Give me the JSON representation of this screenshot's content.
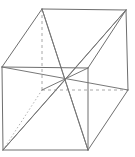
{
  "figure": {
    "type": "line-drawing",
    "projection": "oblique",
    "canvas": {
      "width": 135,
      "height": 157,
      "background": "#ffffff"
    },
    "style": {
      "visible_edge_color": "#6e6e6e",
      "hidden_edge_color": "#a8a8a8",
      "dotted_edge_color": "#b2b2b2",
      "diagonal_color": "#787878",
      "stroke_width": 1
    },
    "vertices": {
      "front_top_left": {
        "name": "A",
        "x": 2,
        "y": 67
      },
      "front_top_right": {
        "name": "B",
        "x": 88,
        "y": 68
      },
      "front_bottom_right": {
        "name": "C",
        "x": 88,
        "y": 150
      },
      "front_bottom_left": {
        "name": "D",
        "x": 3,
        "y": 150
      },
      "back_top_left": {
        "name": "E",
        "x": 42,
        "y": 9
      },
      "back_top_right": {
        "name": "F",
        "x": 126,
        "y": 10
      },
      "back_bottom_right": {
        "name": "G",
        "x": 128,
        "y": 90
      },
      "back_bottom_left": {
        "name": "H",
        "x": 42,
        "y": 90
      },
      "center": {
        "name": "O",
        "x": 65,
        "y": 80
      }
    },
    "edges_visible": [
      {
        "name": "front-top-edge",
        "x1": 2,
        "y1": 67,
        "x2": 88,
        "y2": 68
      },
      {
        "name": "front-right-edge",
        "x1": 88,
        "y1": 68,
        "x2": 88,
        "y2": 150
      },
      {
        "name": "front-bottom-edge",
        "x1": 88,
        "y1": 150,
        "x2": 3,
        "y2": 150
      },
      {
        "name": "front-left-edge",
        "x1": 3,
        "y1": 150,
        "x2": 2,
        "y2": 67
      },
      {
        "name": "back-top-edge",
        "x1": 42,
        "y1": 9,
        "x2": 126,
        "y2": 10
      },
      {
        "name": "back-right-edge",
        "x1": 126,
        "y1": 10,
        "x2": 128,
        "y2": 90
      },
      {
        "name": "connector-top-left",
        "x1": 2,
        "y1": 67,
        "x2": 42,
        "y2": 9
      },
      {
        "name": "connector-top-right",
        "x1": 88,
        "y1": 68,
        "x2": 126,
        "y2": 10
      },
      {
        "name": "connector-bottom-right",
        "x1": 88,
        "y1": 150,
        "x2": 128,
        "y2": 90
      }
    ],
    "edges_hidden": [
      {
        "name": "back-left-edge-dashed",
        "x1": 42,
        "y1": 9,
        "x2": 42,
        "y2": 90,
        "style": "dashed"
      },
      {
        "name": "back-bottom-edge-dashed",
        "x1": 42,
        "y1": 90,
        "x2": 128,
        "y2": 90,
        "style": "dashed"
      },
      {
        "name": "connector-bottom-left-dotted",
        "x1": 3,
        "y1": 150,
        "x2": 42,
        "y2": 90,
        "style": "dotted"
      }
    ],
    "diagonals": [
      {
        "name": "space-diagonal-A-G",
        "x1": 2,
        "y1": 67,
        "x2": 128,
        "y2": 90
      },
      {
        "name": "space-diagonal-D-F",
        "x1": 3,
        "y1": 150,
        "x2": 126,
        "y2": 10
      },
      {
        "name": "space-diagonal-C-E",
        "x1": 88,
        "y1": 150,
        "x2": 42,
        "y2": 9
      },
      {
        "name": "space-diagonal-B-H",
        "x1": 88,
        "y1": 68,
        "x2": 42,
        "y2": 90
      },
      {
        "name": "diagonal-F-to-center",
        "x1": 126,
        "y1": 10,
        "x2": 65,
        "y2": 80
      },
      {
        "name": "diagonal-E-to-center",
        "x1": 42,
        "y1": 9,
        "x2": 65,
        "y2": 80
      },
      {
        "name": "diagonal-D-to-center",
        "x1": 3,
        "y1": 150,
        "x2": 65,
        "y2": 80
      },
      {
        "name": "diagonal-C-to-center",
        "x1": 88,
        "y1": 150,
        "x2": 65,
        "y2": 80
      }
    ]
  }
}
